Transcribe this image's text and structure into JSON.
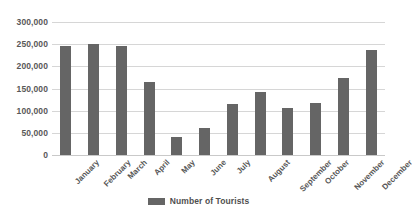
{
  "chart_data": {
    "type": "bar",
    "title": "",
    "xlabel": "",
    "ylabel": "",
    "categories": [
      "January",
      "February",
      "March",
      "April",
      "May",
      "June",
      "July",
      "August",
      "September",
      "October",
      "November",
      "December"
    ],
    "values": [
      245000,
      251000,
      245000,
      165000,
      40000,
      62000,
      115000,
      142000,
      106000,
      117000,
      173000,
      237000
    ],
    "series": [
      {
        "name": "Number of Tourists",
        "values": [
          245000,
          251000,
          245000,
          165000,
          40000,
          62000,
          115000,
          142000,
          106000,
          117000,
          173000,
          237000
        ]
      }
    ],
    "ylim": [
      0,
      300000
    ],
    "yticks": [
      0,
      50000,
      100000,
      150000,
      200000,
      250000,
      300000
    ],
    "ytick_labels": [
      "0",
      "50,000",
      "100,000",
      "150,000",
      "200,000",
      "250,000",
      "300,000"
    ],
    "grid": true,
    "legend_position": "bottom",
    "legend": [
      "Number of Tourists"
    ],
    "bar_color": "#656565",
    "gridline_color": "#d6d6d6",
    "background_color": "#ffffff"
  }
}
